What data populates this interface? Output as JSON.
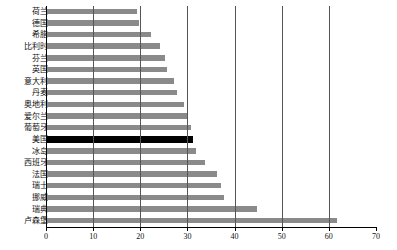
{
  "chart_data": {
    "type": "bar",
    "orientation": "horizontal",
    "title": "",
    "subtitle": "",
    "xlabel": "",
    "ylabel": "",
    "xlim": [
      0,
      70
    ],
    "ylim": null,
    "grid": true,
    "gridlines_axis": "x",
    "legend": null,
    "legend_position": "none",
    "xticks": [
      0,
      10,
      20,
      30,
      40,
      50,
      60,
      70
    ],
    "xtick_labels": [
      "0",
      "10",
      "20",
      "30",
      "40",
      "50",
      "60",
      "70"
    ],
    "categories": [
      "荷兰",
      "德国",
      "希腊",
      "比利时",
      "芬兰",
      "英国",
      "意大利",
      "丹麦",
      "奥地利",
      "爱尔兰",
      "葡萄牙",
      "美国",
      "冰岛",
      "西班牙",
      "法国",
      "瑞士",
      "挪威",
      "瑞典",
      "卢森堡"
    ],
    "values": [
      19,
      19.5,
      22,
      24,
      25,
      25.5,
      27,
      27.5,
      29,
      30,
      30.5,
      31,
      31.5,
      33.5,
      36,
      37,
      37.5,
      44.5,
      61.5
    ],
    "series": [
      {
        "name": "",
        "values": [
          19,
          19.5,
          22,
          24,
          25,
          25.5,
          27,
          27.5,
          29,
          30,
          30.5,
          31,
          31.5,
          33.5,
          36,
          37,
          37.5,
          44.5,
          61.5
        ]
      }
    ],
    "highlight_category": "美国",
    "highlight_index": 11,
    "colors": {
      "bar": "#8a8a8a",
      "highlight_bar": "#000000",
      "gridline": "#555555",
      "axis": "#000000",
      "background": "#ffffff",
      "text": "#111111"
    }
  }
}
